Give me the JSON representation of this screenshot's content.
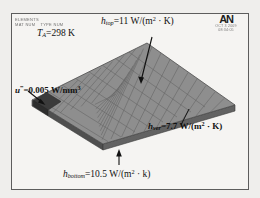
{
  "window": {
    "app": "ANSYS",
    "logo_text": "AN",
    "title_block_lines": [
      [
        "ELEMENTS"
      ],
      [
        "MAT NUM",
        "TYPE NUM"
      ]
    ],
    "stamp_lines": [
      "OCT  3 2009",
      "08:34:05"
    ]
  },
  "annotations": {
    "ambient": {
      "symbol": "T",
      "subscript": "A",
      "equals": "=",
      "value": "298",
      "unit": "K",
      "full_text": "T_A=298 K"
    },
    "h_top": {
      "symbol": "h",
      "subscript": "top",
      "equals": "=",
      "value": "11",
      "unit_num": "W/(m",
      "unit_exp": "2",
      "unit_tail": " · K)",
      "full_text": "h_top=11 W/(m² · K)"
    },
    "u_gen": {
      "symbol": "u",
      "superscript": "‴",
      "equals": "=",
      "value": "0.005",
      "unit_num": "W/mm",
      "unit_exp": "3",
      "full_text": "u‴=0.005 W/mm³"
    },
    "h_ver": {
      "symbol": "h",
      "subscript": "ver",
      "equals": "=",
      "value": "7.7",
      "unit_num": "W/(m",
      "unit_exp": "2",
      "unit_tail": " · K)",
      "full_text": "h_ver=7.7 W/(m² · K)"
    },
    "h_bottom": {
      "symbol": "h",
      "subscript": "bottom",
      "equals": "=",
      "value": "10.5",
      "unit_num": "W/(m",
      "unit_exp": "2",
      "unit_tail": " · k)",
      "full_text": "h_bottom=10.5 W/(m² · k)"
    }
  },
  "model": {
    "description": "meshed-flat-plate-isometric",
    "mesh_cols": 10,
    "mesh_rows": 10,
    "heat_source_patch": "dark-corner-element-block",
    "colors": {
      "plate_top": "#8d8d8d",
      "plate_edge": "#5a5a5a",
      "mesh_line": "#666666",
      "source_patch": "#3a3a3a",
      "background": "#f5f4f2",
      "frame": "#5d5d5d",
      "text": "#111111"
    }
  }
}
